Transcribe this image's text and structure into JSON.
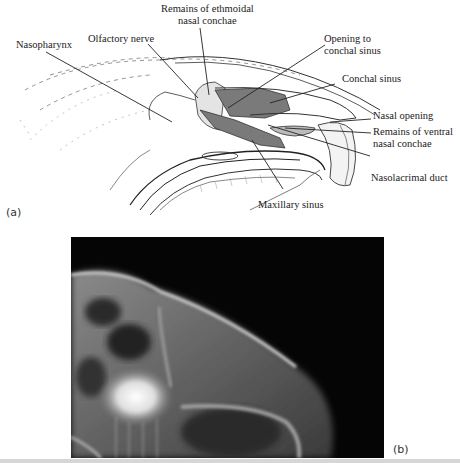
{
  "figure": {
    "panel_a": {
      "label": "(a)",
      "annotations": [
        {
          "id": "ethmoidal",
          "lines": [
            "Remains of ethmoidal",
            "nasal conchae"
          ]
        },
        {
          "id": "olfactory",
          "lines": [
            "Olfactory nerve"
          ]
        },
        {
          "id": "opening",
          "lines": [
            "Opening to",
            "conchal sinus"
          ]
        },
        {
          "id": "nasopharynx",
          "lines": [
            "Nasopharynx"
          ]
        },
        {
          "id": "conchal",
          "lines": [
            "Conchal sinus"
          ]
        },
        {
          "id": "nasal_opening",
          "lines": [
            "Nasal opening"
          ]
        },
        {
          "id": "ventral",
          "lines": [
            "Remains of ventral",
            "nasal conchae"
          ]
        },
        {
          "id": "nasolacrimal",
          "lines": [
            "Nasolacrimal duct"
          ]
        },
        {
          "id": "maxillary",
          "lines": [
            "Maxillary sinus"
          ]
        }
      ]
    },
    "panel_b": {
      "label": "(b)"
    },
    "colors": {
      "sinus_fill": "#7a7a7a",
      "line": "#222222",
      "xray_bg": "#050505"
    }
  }
}
